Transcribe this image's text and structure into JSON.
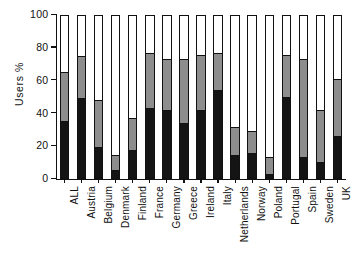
{
  "chart_data": {
    "type": "bar",
    "subtype": "stacked-bar-100-percent",
    "title": "",
    "xlabel": "",
    "ylabel": "Users  %",
    "ylim": [
      0,
      100
    ],
    "yticks": [
      0,
      20,
      40,
      60,
      80,
      100
    ],
    "ytick_labels": [
      "0",
      "20",
      "40",
      "60",
      "80",
      "100"
    ],
    "grid": false,
    "legend": "none",
    "categories": [
      "ALL",
      "Austria",
      "Belgium",
      "Denmark",
      "Finland",
      "France",
      "Germany",
      "Greece",
      "Ireland",
      "Italy",
      "Netherlands",
      "Norway",
      "Poland",
      "Portugal",
      "Spain",
      "Sweden",
      "UK"
    ],
    "series": [
      {
        "name": "black-segment",
        "color": "#141414",
        "values": [
          35,
          49,
          19,
          5,
          17,
          43,
          42,
          34,
          42,
          54,
          14,
          15,
          2,
          50,
          13,
          10,
          26
        ]
      },
      {
        "name": "grey-segment",
        "color": "#8d8d8d",
        "values": [
          30,
          26,
          29,
          9,
          20,
          34,
          31,
          39,
          34,
          23,
          17,
          14,
          11,
          26,
          60,
          32,
          35
        ]
      },
      {
        "name": "white-segment",
        "color": "#ffffff",
        "values": [
          35,
          25,
          52,
          86,
          63,
          23,
          27,
          27,
          24,
          23,
          69,
          71,
          87,
          24,
          27,
          58,
          39
        ]
      }
    ],
    "cumulative_tops": {
      "black": [
        35,
        49,
        19,
        5,
        17,
        43,
        42,
        34,
        42,
        54,
        14,
        15,
        2,
        50,
        13,
        10,
        26
      ],
      "black_plus_grey": [
        65,
        75,
        48,
        14,
        37,
        77,
        73,
        73,
        76,
        77,
        31,
        29,
        13,
        76,
        73,
        42,
        61
      ],
      "total": [
        100,
        100,
        100,
        100,
        100,
        100,
        100,
        100,
        100,
        100,
        100,
        100,
        100,
        100,
        100,
        100,
        100
      ]
    }
  }
}
